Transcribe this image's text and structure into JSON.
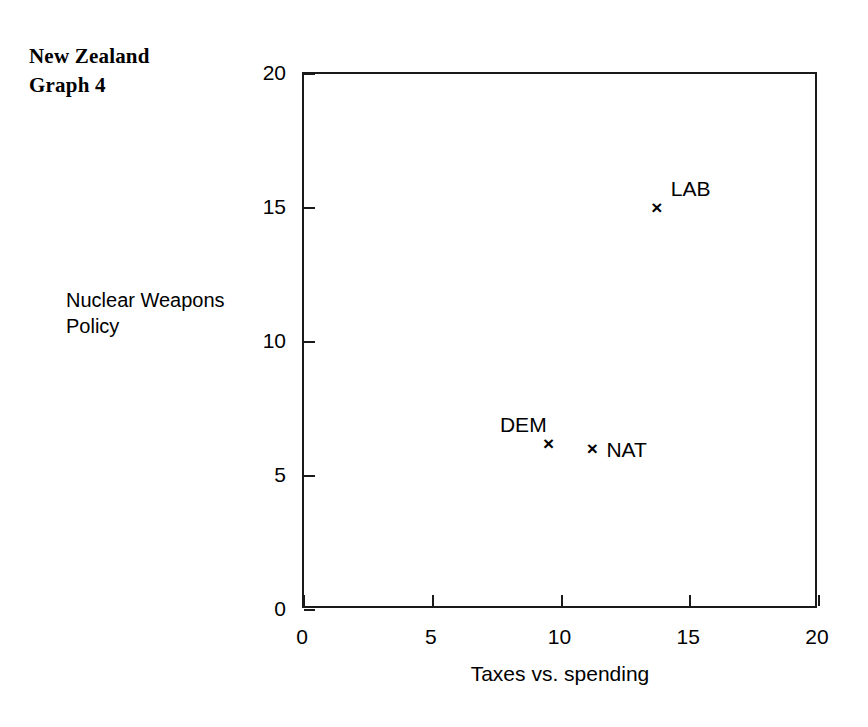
{
  "figure": {
    "title": "New Zealand\nGraph 4"
  },
  "chart_data": {
    "type": "scatter",
    "title": "New Zealand Graph 4",
    "xlabel": "Taxes vs. spending",
    "ylabel": "Nuclear Weapons Policy",
    "xlim": [
      0,
      20
    ],
    "ylim": [
      0,
      20
    ],
    "xticks": [
      "0",
      "5",
      "10",
      "15",
      "20"
    ],
    "yticks": [
      "0",
      "5",
      "10",
      "15",
      "20"
    ],
    "xtick_values": [
      0,
      5,
      10,
      15,
      20
    ],
    "ytick_values": [
      0,
      5,
      10,
      15,
      20
    ],
    "grid": false,
    "legend": "none",
    "marker": "x",
    "points": [
      {
        "label": "LAB",
        "x": 13.7,
        "y": 15.0,
        "label_position": "up-right"
      },
      {
        "label": "DEM",
        "x": 9.5,
        "y": 6.2,
        "label_position": "up-left"
      },
      {
        "label": "NAT",
        "x": 11.2,
        "y": 6.0,
        "label_position": "right"
      }
    ],
    "marker_glyph": "×",
    "colors": {
      "axis": "#1a1a1a",
      "marker": "#000000",
      "background": "#ffffff"
    }
  }
}
